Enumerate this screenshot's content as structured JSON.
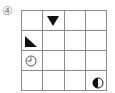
{
  "label": "④",
  "grid": {
    "rows": 4,
    "cols": 4,
    "line_color": "#8a8a8a",
    "symbol_color": "#111111",
    "cells": [
      [
        {
          "symbol": ""
        },
        {
          "symbol": "triangle-down-filled"
        },
        {
          "symbol": ""
        },
        {
          "symbol": ""
        }
      ],
      [
        {
          "symbol": "right-triangle-filled"
        },
        {
          "symbol": ""
        },
        {
          "symbol": ""
        },
        {
          "symbol": ""
        }
      ],
      [
        {
          "symbol": "clock-outline"
        },
        {
          "symbol": ""
        },
        {
          "symbol": ""
        },
        {
          "symbol": ""
        }
      ],
      [
        {
          "symbol": ""
        },
        {
          "symbol": ""
        },
        {
          "symbol": ""
        },
        {
          "symbol": "half-circle-left-filled"
        }
      ]
    ]
  }
}
